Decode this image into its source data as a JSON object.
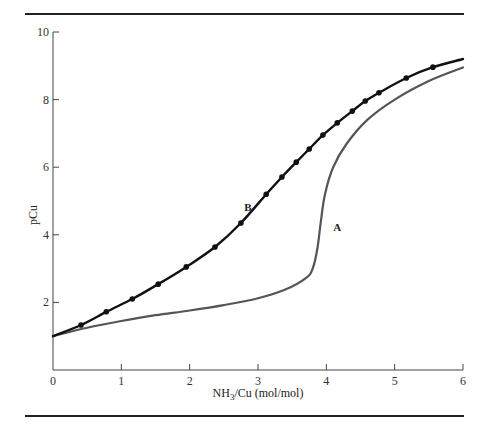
{
  "figure": {
    "rule_top": true,
    "rule_bottom": true
  },
  "chart_data": {
    "type": "line",
    "title": "",
    "xlabel": "NH3/Cu (mol/mol)",
    "xlabel_parts": {
      "pre": "NH",
      "sub": "3",
      "post": "/Cu (mol/mol)"
    },
    "ylabel": "pCu",
    "xlim": [
      0,
      6
    ],
    "ylim": [
      0,
      10
    ],
    "x_ticks": [
      0,
      1,
      2,
      3,
      4,
      5,
      6
    ],
    "x_tick_labels": [
      "0",
      "1",
      "2",
      "3",
      "4",
      "5",
      "6"
    ],
    "y_ticks": [
      2,
      4,
      6,
      8,
      10
    ],
    "y_tick_labels": [
      "2",
      "4",
      "6",
      "8",
      "10"
    ],
    "grid": false,
    "legend": "none (curves labeled inline)",
    "series": [
      {
        "name": "A",
        "label": "A",
        "color": "#555555",
        "markers": false,
        "label_position": {
          "x": 4.1,
          "y": 4.1
        },
        "points": [
          {
            "x": 0.0,
            "y": 1.0
          },
          {
            "x": 0.5,
            "y": 1.25
          },
          {
            "x": 1.0,
            "y": 1.45
          },
          {
            "x": 1.5,
            "y": 1.62
          },
          {
            "x": 2.0,
            "y": 1.76
          },
          {
            "x": 2.5,
            "y": 1.92
          },
          {
            "x": 3.0,
            "y": 2.12
          },
          {
            "x": 3.4,
            "y": 2.38
          },
          {
            "x": 3.7,
            "y": 2.72
          },
          {
            "x": 3.8,
            "y": 3.0
          },
          {
            "x": 3.87,
            "y": 3.6
          },
          {
            "x": 3.92,
            "y": 4.4
          },
          {
            "x": 3.98,
            "y": 5.2
          },
          {
            "x": 4.1,
            "y": 6.0
          },
          {
            "x": 4.3,
            "y": 6.7
          },
          {
            "x": 4.6,
            "y": 7.4
          },
          {
            "x": 5.0,
            "y": 8.0
          },
          {
            "x": 5.5,
            "y": 8.55
          },
          {
            "x": 6.0,
            "y": 8.95
          }
        ]
      },
      {
        "name": "B",
        "label": "B",
        "color": "#111111",
        "markers": true,
        "label_position": {
          "x": 2.8,
          "y": 4.7
        },
        "points": [
          {
            "x": 0.0,
            "y": 1.0
          },
          {
            "x": 0.41,
            "y": 1.33
          },
          {
            "x": 0.78,
            "y": 1.72
          },
          {
            "x": 1.16,
            "y": 2.1
          },
          {
            "x": 1.54,
            "y": 2.54
          },
          {
            "x": 1.95,
            "y": 3.05
          },
          {
            "x": 2.37,
            "y": 3.64
          },
          {
            "x": 2.75,
            "y": 4.35
          },
          {
            "x": 3.12,
            "y": 5.2
          },
          {
            "x": 3.35,
            "y": 5.71
          },
          {
            "x": 3.56,
            "y": 6.15
          },
          {
            "x": 3.75,
            "y": 6.54
          },
          {
            "x": 3.95,
            "y": 6.95
          },
          {
            "x": 4.16,
            "y": 7.31
          },
          {
            "x": 4.38,
            "y": 7.66
          },
          {
            "x": 4.57,
            "y": 7.96
          },
          {
            "x": 4.77,
            "y": 8.2
          },
          {
            "x": 5.17,
            "y": 8.64
          },
          {
            "x": 5.56,
            "y": 8.96
          },
          {
            "x": 6.0,
            "y": 9.2
          }
        ],
        "marker_points_exclude_endpoints": true
      }
    ]
  }
}
